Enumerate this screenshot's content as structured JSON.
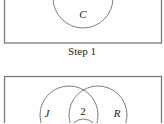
{
  "panels": [
    {
      "id": "step1",
      "caption": "Step 1",
      "box": {
        "x": 4.5,
        "y": -10,
        "width": 157,
        "height": 53
      },
      "circles": [
        {
          "label": "C",
          "cx": 83,
          "cy": -2,
          "r": 30,
          "label_x": 83,
          "label_y": 18
        }
      ],
      "region_values": []
    },
    {
      "id": "step2",
      "caption": "",
      "box": {
        "x": 4.5,
        "y": 76.5,
        "width": 157,
        "height": 60
      },
      "circles": [
        {
          "label": "J",
          "cx": 69,
          "cy": 115,
          "r": 29,
          "label_x": 47,
          "label_y": 116
        },
        {
          "label": "R",
          "cx": 98,
          "cy": 115,
          "r": 29,
          "label_x": 117,
          "label_y": 117
        },
        {
          "label": "",
          "cx": 83.5,
          "cy": 132,
          "r": 22
        }
      ],
      "region_values": [
        {
          "region": "J∩R only",
          "value": "2",
          "x": 83,
          "y": 115
        }
      ]
    }
  ],
  "colors": {
    "stroke": "#6f6f6f",
    "box_stroke": "#7a7a7a",
    "text": "#222222",
    "background": "#ffffff"
  },
  "labels": {
    "step1_caption": "Step 1",
    "circle_c": "C",
    "circle_j": "J",
    "circle_r": "R",
    "lens_jr_value": "2"
  }
}
